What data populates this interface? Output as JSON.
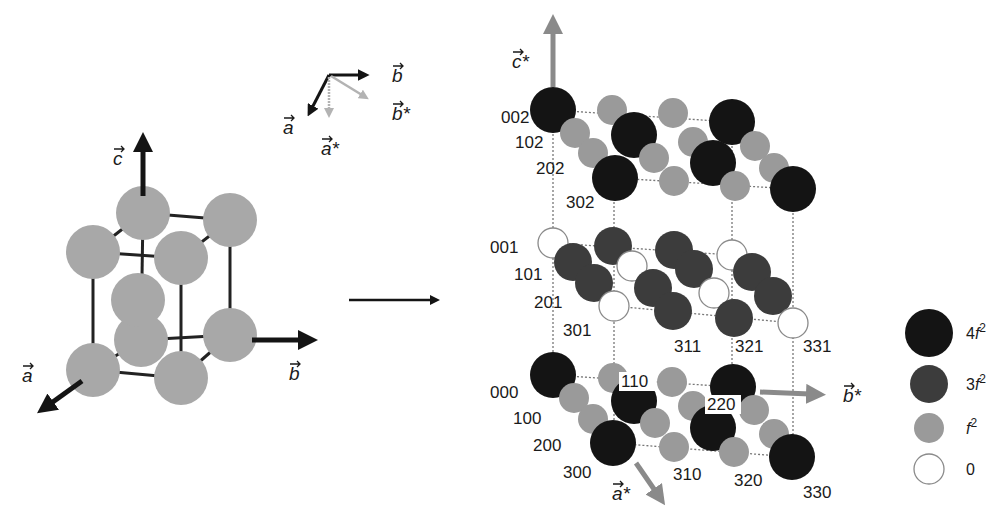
{
  "colors": {
    "black_sphere": "#141414",
    "dark_sphere": "#3c3c3c",
    "gray_sphere": "#9a9a9a",
    "light_sphere_left": "#a8a8a8",
    "white_sphere": "#ffffff",
    "axis_black": "#141414",
    "axis_gray": "#8a8a8a",
    "bond": "#222222",
    "dotted": "#777777"
  },
  "real_lattice": {
    "axes": {
      "a": "a",
      "b": "b",
      "c": "c"
    },
    "atoms": [
      {
        "x": 141,
        "y": 340,
        "r": 27
      },
      {
        "x": 230,
        "y": 335,
        "r": 27
      },
      {
        "x": 138,
        "y": 300,
        "r": 27
      },
      {
        "x": 93,
        "y": 370,
        "r": 27
      },
      {
        "x": 181,
        "y": 378,
        "r": 27
      },
      {
        "x": 143,
        "y": 213,
        "r": 27
      },
      {
        "x": 230,
        "y": 220,
        "r": 27
      },
      {
        "x": 93,
        "y": 252,
        "r": 27
      },
      {
        "x": 181,
        "y": 258,
        "r": 27
      }
    ]
  },
  "basis_inset": {
    "real": [
      "a",
      "b"
    ],
    "reciprocal": [
      "a*",
      "b*"
    ]
  },
  "transform_arrow": "→",
  "reciprocal_lattice": {
    "axes": {
      "a_star": "a*",
      "b_star": "b*",
      "c_star": "c*"
    },
    "spheres": [
      {
        "x": 553,
        "y": 110,
        "r": 23,
        "kind": "4f2"
      },
      {
        "x": 612,
        "y": 110,
        "r": 15,
        "kind": "f2"
      },
      {
        "x": 673,
        "y": 113,
        "r": 15,
        "kind": "f2"
      },
      {
        "x": 732,
        "y": 122,
        "r": 23,
        "kind": "4f2"
      },
      {
        "x": 575,
        "y": 133,
        "r": 15,
        "kind": "f2"
      },
      {
        "x": 634,
        "y": 135,
        "r": 23,
        "kind": "4f2"
      },
      {
        "x": 693,
        "y": 142,
        "r": 15,
        "kind": "f2"
      },
      {
        "x": 755,
        "y": 146,
        "r": 15,
        "kind": "f2"
      },
      {
        "x": 593,
        "y": 153,
        "r": 15,
        "kind": "f2"
      },
      {
        "x": 654,
        "y": 158,
        "r": 15,
        "kind": "f2"
      },
      {
        "x": 713,
        "y": 163,
        "r": 23,
        "kind": "4f2"
      },
      {
        "x": 774,
        "y": 168,
        "r": 15,
        "kind": "f2"
      },
      {
        "x": 615,
        "y": 178,
        "r": 23,
        "kind": "4f2"
      },
      {
        "x": 674,
        "y": 181,
        "r": 15,
        "kind": "f2"
      },
      {
        "x": 735,
        "y": 186,
        "r": 15,
        "kind": "f2"
      },
      {
        "x": 793,
        "y": 189,
        "r": 23,
        "kind": "4f2"
      },
      {
        "x": 553,
        "y": 243,
        "r": 15,
        "kind": "0"
      },
      {
        "x": 613,
        "y": 246,
        "r": 19,
        "kind": "3f2"
      },
      {
        "x": 674,
        "y": 250,
        "r": 19,
        "kind": "3f2"
      },
      {
        "x": 732,
        "y": 255,
        "r": 15,
        "kind": "0"
      },
      {
        "x": 573,
        "y": 262,
        "r": 19,
        "kind": "3f2"
      },
      {
        "x": 632,
        "y": 266,
        "r": 15,
        "kind": "0"
      },
      {
        "x": 694,
        "y": 269,
        "r": 19,
        "kind": "3f2"
      },
      {
        "x": 752,
        "y": 272,
        "r": 19,
        "kind": "3f2"
      },
      {
        "x": 594,
        "y": 283,
        "r": 19,
        "kind": "3f2"
      },
      {
        "x": 653,
        "y": 288,
        "r": 19,
        "kind": "3f2"
      },
      {
        "x": 714,
        "y": 293,
        "r": 15,
        "kind": "0"
      },
      {
        "x": 773,
        "y": 296,
        "r": 19,
        "kind": "3f2"
      },
      {
        "x": 614,
        "y": 306,
        "r": 15,
        "kind": "0"
      },
      {
        "x": 673,
        "y": 311,
        "r": 19,
        "kind": "3f2"
      },
      {
        "x": 734,
        "y": 318,
        "r": 19,
        "kind": "3f2"
      },
      {
        "x": 793,
        "y": 323,
        "r": 15,
        "kind": "0"
      },
      {
        "x": 553,
        "y": 375,
        "r": 23,
        "kind": "4f2"
      },
      {
        "x": 613,
        "y": 378,
        "r": 15,
        "kind": "f2"
      },
      {
        "x": 672,
        "y": 382,
        "r": 15,
        "kind": "f2"
      },
      {
        "x": 733,
        "y": 387,
        "r": 23,
        "kind": "4f2"
      },
      {
        "x": 574,
        "y": 398,
        "r": 15,
        "kind": "f2"
      },
      {
        "x": 634,
        "y": 401,
        "r": 23,
        "kind": "4f2"
      },
      {
        "x": 693,
        "y": 406,
        "r": 15,
        "kind": "f2"
      },
      {
        "x": 754,
        "y": 410,
        "r": 15,
        "kind": "f2"
      },
      {
        "x": 593,
        "y": 419,
        "r": 15,
        "kind": "f2"
      },
      {
        "x": 655,
        "y": 423,
        "r": 15,
        "kind": "f2"
      },
      {
        "x": 713,
        "y": 428,
        "r": 23,
        "kind": "4f2"
      },
      {
        "x": 774,
        "y": 434,
        "r": 15,
        "kind": "f2"
      },
      {
        "x": 613,
        "y": 443,
        "r": 23,
        "kind": "4f2"
      },
      {
        "x": 674,
        "y": 447,
        "r": 15,
        "kind": "f2"
      },
      {
        "x": 734,
        "y": 452,
        "r": 15,
        "kind": "f2"
      },
      {
        "x": 792,
        "y": 457,
        "r": 23,
        "kind": "4f2"
      }
    ],
    "labels": [
      {
        "text": "002",
        "x": 501,
        "y": 123
      },
      {
        "text": "102",
        "x": 515,
        "y": 148
      },
      {
        "text": "202",
        "x": 536,
        "y": 174
      },
      {
        "text": "302",
        "x": 566,
        "y": 208
      },
      {
        "text": "001",
        "x": 490,
        "y": 253
      },
      {
        "text": "101",
        "x": 514,
        "y": 280
      },
      {
        "text": "201",
        "x": 534,
        "y": 308
      },
      {
        "text": "301",
        "x": 563,
        "y": 336
      },
      {
        "text": "311",
        "x": 674,
        "y": 352
      },
      {
        "text": "321",
        "x": 735,
        "y": 352
      },
      {
        "text": "331",
        "x": 803,
        "y": 352
      },
      {
        "text": "000",
        "x": 490,
        "y": 398
      },
      {
        "text": "100",
        "x": 513,
        "y": 424
      },
      {
        "text": "200",
        "x": 533,
        "y": 451
      },
      {
        "text": "300",
        "x": 563,
        "y": 478
      },
      {
        "text": "110",
        "x": 621,
        "y": 387
      },
      {
        "text": "220",
        "x": 707,
        "y": 410
      },
      {
        "text": "310",
        "x": 673,
        "y": 480
      },
      {
        "text": "320",
        "x": 734,
        "y": 486
      },
      {
        "text": "330",
        "x": 803,
        "y": 498
      }
    ]
  },
  "legend": {
    "items": [
      {
        "label": "4f",
        "sup": "2",
        "kind": "4f2"
      },
      {
        "label": "3f",
        "sup": "2",
        "kind": "3f2"
      },
      {
        "label": "f",
        "sup": "2",
        "kind": "f2"
      },
      {
        "label": "0",
        "sup": "",
        "kind": "0"
      }
    ]
  },
  "caption": "Fig. ... (partially cropped caption text, not legible)"
}
